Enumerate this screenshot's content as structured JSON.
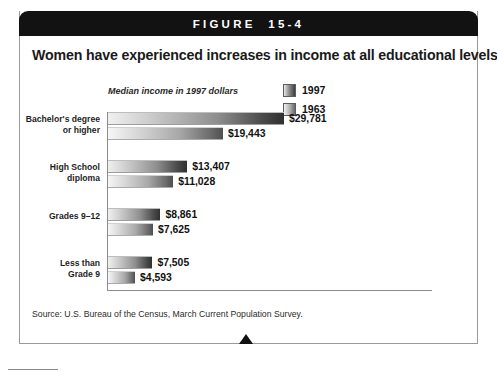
{
  "figure": {
    "header_label": "FIGURE  15-4",
    "title": "Women have experienced increases in income at all educational levels.",
    "source": "Source: U.S. Bureau of the Census, March Current Population Survey."
  },
  "legend": {
    "items": [
      {
        "label": "1997",
        "color": "#3d3d3d"
      },
      {
        "label": "1963",
        "color": "#676767"
      }
    ]
  },
  "chart_data": {
    "type": "bar",
    "orientation": "horizontal",
    "title": "Women have experienced increases in income at all educational levels.",
    "subtitle": "",
    "xlabel": "Median income in 1997 dollars",
    "ylabel": "",
    "axis_caption": "Median income in 1997 dollars",
    "categories": [
      "Bachelor's degree or higher",
      "High School diploma",
      "Grades 9–12",
      "Less than Grade 9"
    ],
    "category_lines": [
      [
        "Bachelor's degree",
        "or higher"
      ],
      [
        "High School",
        "diploma"
      ],
      [
        "Grades 9–12",
        ""
      ],
      [
        "Less than",
        "Grade 9"
      ]
    ],
    "series": [
      {
        "name": "1997",
        "values": [
          29781,
          19443,
          8861,
          7505
        ],
        "labels": [
          "$29,781",
          "$13,407",
          "$8,861",
          "$7,505"
        ]
      },
      {
        "name": "1963",
        "values": [
          19443,
          11028,
          7625,
          4593
        ],
        "labels": [
          "$19,443",
          "$11,028",
          "$7,625",
          "$4,593"
        ]
      }
    ],
    "bars": [
      {
        "category": "Bachelor's degree or higher",
        "series": "1997",
        "value": 29781,
        "label": "$29,781"
      },
      {
        "category": "Bachelor's degree or higher",
        "series": "1963",
        "value": 19443,
        "label": "$19,443"
      },
      {
        "category": "High School diploma",
        "series": "1997",
        "value": 13407,
        "label": "$13,407"
      },
      {
        "category": "High School diploma",
        "series": "1963",
        "value": 11028,
        "label": "$11,028"
      },
      {
        "category": "Grades 9–12",
        "series": "1997",
        "value": 8861,
        "label": "$8,861"
      },
      {
        "category": "Grades 9–12",
        "series": "1963",
        "value": 7625,
        "label": "$7,625"
      },
      {
        "category": "Less than Grade 9",
        "series": "1997",
        "value": 7505,
        "label": "$7,505"
      },
      {
        "category": "Less than Grade 9",
        "series": "1963",
        "value": 4593,
        "label": "$4,593"
      }
    ],
    "xlim": [
      0,
      29781
    ],
    "grid": false,
    "legend_position": "top-right",
    "value_unit": "1997 dollars"
  }
}
